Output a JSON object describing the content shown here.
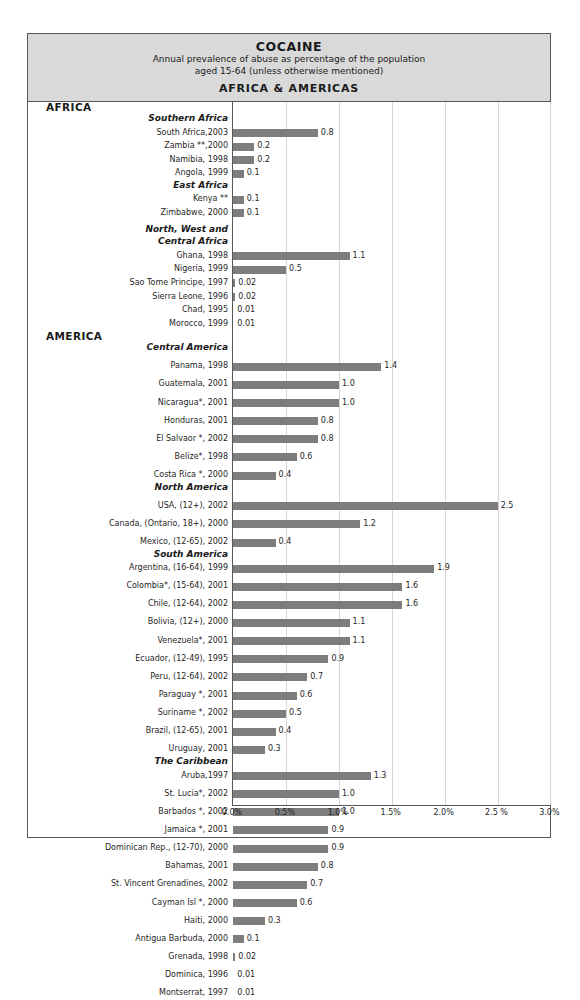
{
  "header": {
    "title": "COCAINE",
    "subtitle_line1": "Annual prevalence of abuse as percentage of the population",
    "subtitle_line2": "aged 15-64 (unless otherwise mentioned)",
    "region_title": "AFRICA & AMERICAS"
  },
  "chart_data": {
    "type": "bar",
    "orientation": "horizontal",
    "title": "COCAINE",
    "subtitle": "Annual prevalence of abuse as percentage of the population aged 15-64 (unless otherwise mentioned)",
    "region": "AFRICA & AMERICAS",
    "xlabel": "",
    "ylabel": "",
    "xlim": [
      0,
      3.0
    ],
    "xticks": [
      "0.0%",
      "0.5%",
      "1.0%",
      "1.5%",
      "2.0%",
      "2.5 %",
      "3.0%"
    ],
    "xtick_values": [
      0,
      0.5,
      1.0,
      1.5,
      2.0,
      2.5,
      3.0
    ],
    "grid": true,
    "legend": "none",
    "bar_color": "#7d7d7d",
    "rows": [
      {
        "kind": "region",
        "label": "AFRICA"
      },
      {
        "kind": "group",
        "label": "Southern Africa"
      },
      {
        "kind": "bar",
        "label": "South Africa,2003",
        "value": 0.8,
        "display": "0.8"
      },
      {
        "kind": "bar",
        "label": "Zambia **,2000",
        "value": 0.2,
        "display": "0.2"
      },
      {
        "kind": "bar",
        "label": "Namibia, 1998",
        "value": 0.2,
        "display": "0.2"
      },
      {
        "kind": "bar",
        "label": "Angola, 1999",
        "value": 0.1,
        "display": "0.1"
      },
      {
        "kind": "group",
        "label": "East Africa"
      },
      {
        "kind": "bar",
        "label": "Kenya  **",
        "value": 0.1,
        "display": "0.1"
      },
      {
        "kind": "bar",
        "label": "Zimbabwe, 2000",
        "value": 0.1,
        "display": "0.1"
      },
      {
        "kind": "spacer"
      },
      {
        "kind": "group",
        "label": "North, West and"
      },
      {
        "kind": "group",
        "label": "Central Africa"
      },
      {
        "kind": "bar",
        "label": "Ghana,  1998",
        "value": 1.1,
        "display": "1.1"
      },
      {
        "kind": "bar",
        "label": "Nigeria, 1999",
        "value": 0.5,
        "display": "0.5"
      },
      {
        "kind": "bar",
        "label": "Sao Tome Principe, 1997",
        "value": 0.02,
        "display": "0.02"
      },
      {
        "kind": "bar",
        "label": "Sierra Leone,  1996",
        "value": 0.02,
        "display": "0.02"
      },
      {
        "kind": "bar",
        "label": "Chad,  1995",
        "value": 0.01,
        "display": "0.01"
      },
      {
        "kind": "bar",
        "label": "Morocco, 1999",
        "value": 0.01,
        "display": "0.01"
      },
      {
        "kind": "region",
        "label": "AMERICA"
      },
      {
        "kind": "group",
        "label": "Central America"
      },
      {
        "kind": "spacer"
      },
      {
        "kind": "bar",
        "label": "Panama, 1998",
        "value": 1.4,
        "display": "1.4"
      },
      {
        "kind": "spacer"
      },
      {
        "kind": "bar",
        "label": "Guatemala, 2001",
        "value": 1.0,
        "display": "1.0"
      },
      {
        "kind": "spacer"
      },
      {
        "kind": "bar",
        "label": "Nicaragua*, 2001",
        "value": 1.0,
        "display": "1.0"
      },
      {
        "kind": "spacer"
      },
      {
        "kind": "bar",
        "label": "Honduras,  2001",
        "value": 0.8,
        "display": "0.8"
      },
      {
        "kind": "spacer"
      },
      {
        "kind": "bar",
        "label": "El Salvaor  *, 2002",
        "value": 0.8,
        "display": "0.8"
      },
      {
        "kind": "spacer"
      },
      {
        "kind": "bar",
        "label": "Belize*, 1998",
        "value": 0.6,
        "display": "0.6"
      },
      {
        "kind": "spacer"
      },
      {
        "kind": "bar",
        "label": "Costa Rica *, 2000",
        "value": 0.4,
        "display": "0.4"
      },
      {
        "kind": "group",
        "label": "North America"
      },
      {
        "kind": "spacer"
      },
      {
        "kind": "bar",
        "label": "USA, (12+), 2002",
        "value": 2.5,
        "display": "2.5"
      },
      {
        "kind": "spacer"
      },
      {
        "kind": "bar",
        "label": "Canada, (Ontario, 18+), 2000",
        "value": 1.2,
        "display": "1.2"
      },
      {
        "kind": "spacer"
      },
      {
        "kind": "bar",
        "label": "Mexico, (12-65), 2002",
        "value": 0.4,
        "display": "0.4"
      },
      {
        "kind": "group",
        "label": "South America"
      },
      {
        "kind": "bar",
        "label": "Argentina, (16-64), 1999",
        "value": 1.9,
        "display": "1.9"
      },
      {
        "kind": "spacer"
      },
      {
        "kind": "bar",
        "label": "Colombia*, (15-64), 2001",
        "value": 1.6,
        "display": "1.6"
      },
      {
        "kind": "spacer"
      },
      {
        "kind": "bar",
        "label": "Chile, (12-64), 2002",
        "value": 1.6,
        "display": "1.6"
      },
      {
        "kind": "spacer"
      },
      {
        "kind": "bar",
        "label": "Bolivia, (12+), 2000",
        "value": 1.1,
        "display": "1.1"
      },
      {
        "kind": "spacer"
      },
      {
        "kind": "bar",
        "label": "Venezuela*, 2001",
        "value": 1.1,
        "display": "1.1"
      },
      {
        "kind": "spacer"
      },
      {
        "kind": "bar",
        "label": "Ecuador, (12-49), 1995",
        "value": 0.9,
        "display": "0.9"
      },
      {
        "kind": "spacer"
      },
      {
        "kind": "bar",
        "label": "Peru, (12-64), 2002",
        "value": 0.7,
        "display": "0.7"
      },
      {
        "kind": "spacer"
      },
      {
        "kind": "bar",
        "label": "Paraguay *, 2001",
        "value": 0.6,
        "display": "0.6"
      },
      {
        "kind": "spacer"
      },
      {
        "kind": "bar",
        "label": "Suriname *, 2002",
        "value": 0.5,
        "display": "0.5"
      },
      {
        "kind": "spacer"
      },
      {
        "kind": "bar",
        "label": "Brazil, (12-65), 2001",
        "value": 0.4,
        "display": "0.4"
      },
      {
        "kind": "spacer"
      },
      {
        "kind": "bar",
        "label": "Uruguay, 2001",
        "value": 0.3,
        "display": "0.3"
      },
      {
        "kind": "group",
        "label": "The Caribbean"
      },
      {
        "kind": "bar",
        "label": "Aruba,1997",
        "value": 1.3,
        "display": "1.3"
      },
      {
        "kind": "spacer"
      },
      {
        "kind": "bar",
        "label": "St. Lucia*, 2002",
        "value": 1.0,
        "display": "1.0"
      },
      {
        "kind": "spacer"
      },
      {
        "kind": "bar",
        "label": "Barbados *, 2002",
        "value": 1.0,
        "display": "1.0"
      },
      {
        "kind": "spacer"
      },
      {
        "kind": "bar",
        "label": "Jamaica *, 2001",
        "value": 0.9,
        "display": "0.9"
      },
      {
        "kind": "spacer"
      },
      {
        "kind": "bar",
        "label": "Dominican Rep., (12-70), 2000",
        "value": 0.9,
        "display": "0.9"
      },
      {
        "kind": "spacer"
      },
      {
        "kind": "bar",
        "label": "Bahamas, 2001",
        "value": 0.8,
        "display": "0.8"
      },
      {
        "kind": "spacer"
      },
      {
        "kind": "bar",
        "label": "St. Vincent Grenadines, 2002",
        "value": 0.7,
        "display": "0.7"
      },
      {
        "kind": "spacer"
      },
      {
        "kind": "bar",
        "label": "Cayman Isl *, 2000",
        "value": 0.6,
        "display": "0.6"
      },
      {
        "kind": "spacer"
      },
      {
        "kind": "bar",
        "label": "Haiti,  2000",
        "value": 0.3,
        "display": "0.3"
      },
      {
        "kind": "spacer"
      },
      {
        "kind": "bar",
        "label": "Antigua Barbuda, 2000",
        "value": 0.1,
        "display": "0.1"
      },
      {
        "kind": "spacer"
      },
      {
        "kind": "bar",
        "label": "Grenada, 1998",
        "value": 0.02,
        "display": "0.02"
      },
      {
        "kind": "spacer"
      },
      {
        "kind": "bar",
        "label": "Dominica,  1996",
        "value": 0.01,
        "display": "0.01"
      },
      {
        "kind": "spacer"
      },
      {
        "kind": "bar",
        "label": "Montserrat, 1997",
        "value": 0.01,
        "display": "0.01"
      }
    ]
  }
}
